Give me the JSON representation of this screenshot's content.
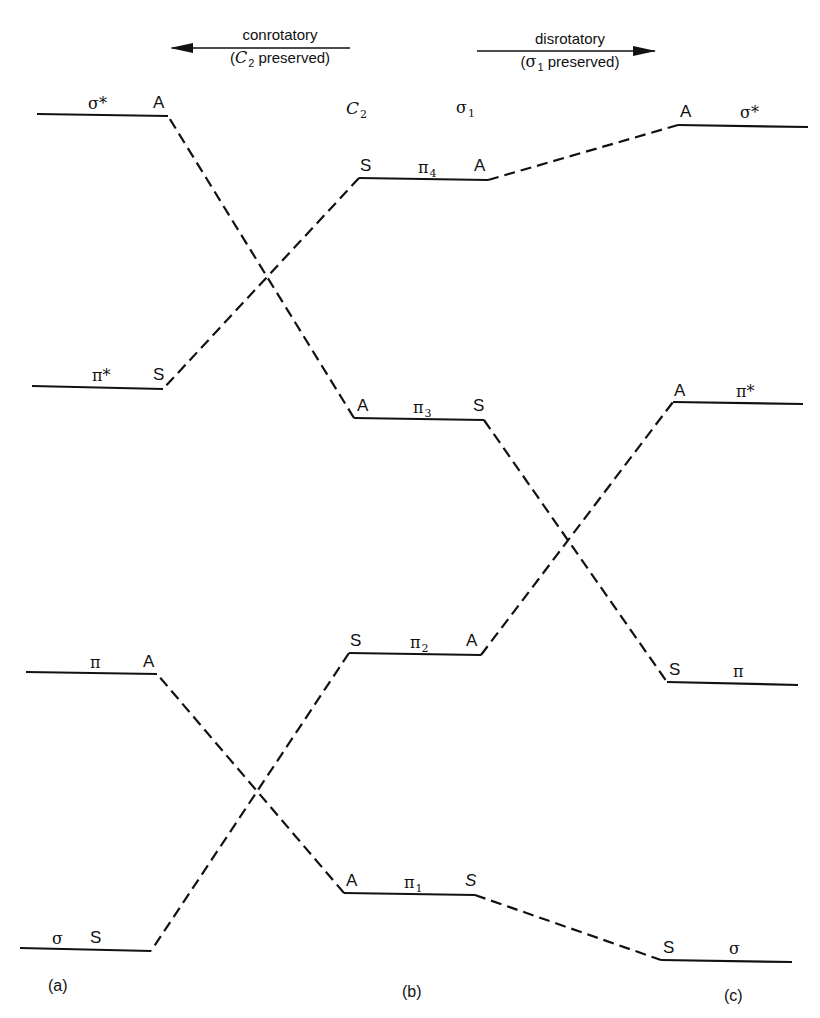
{
  "header": {
    "conrotatory": {
      "label": "conrotatory",
      "note_prefix": "(",
      "note_symbol": "C",
      "note_sub": "2",
      "note_suffix": " preserved)",
      "arrow_direction": "left"
    },
    "disrotatory": {
      "label": "disrotatory",
      "note_prefix": "(",
      "note_symbol": "σ",
      "note_sub": "1",
      "note_suffix": " preserved)",
      "arrow_direction": "right"
    }
  },
  "symmetry_elements": {
    "c2": {
      "symbol": "C",
      "sub": "2"
    },
    "sigma1": {
      "symbol": "σ",
      "sub": "1"
    }
  },
  "columns": {
    "a": {
      "label": "(a)",
      "levels": [
        {
          "orbital": "σ*",
          "symmetry": "A"
        },
        {
          "orbital": "π*",
          "symmetry": "S"
        },
        {
          "orbital": "π",
          "symmetry": "A"
        },
        {
          "orbital": "σ",
          "symmetry": "S"
        }
      ]
    },
    "b": {
      "label": "(b)",
      "levels": [
        {
          "orbital": "π",
          "sub": "4",
          "c2": "S",
          "sigma": "A"
        },
        {
          "orbital": "π",
          "sub": "3",
          "c2": "A",
          "sigma": "S"
        },
        {
          "orbital": "π",
          "sub": "2",
          "c2": "S",
          "sigma": "A"
        },
        {
          "orbital": "π",
          "sub": "1",
          "c2": "A",
          "sigma": "S"
        }
      ]
    },
    "c": {
      "label": "(c)",
      "levels": [
        {
          "orbital": "σ*",
          "symmetry": "A"
        },
        {
          "orbital": "π*",
          "symmetry": "A"
        },
        {
          "orbital": "π",
          "symmetry": "S"
        },
        {
          "orbital": "σ",
          "symmetry": "S"
        }
      ]
    }
  },
  "correlations": {
    "conrotatory": [
      {
        "from": "π4",
        "to": "π*"
      },
      {
        "from": "π3",
        "to": "σ*"
      },
      {
        "from": "π2",
        "to": "σ"
      },
      {
        "from": "π1",
        "to": "π"
      }
    ],
    "disrotatory": [
      {
        "from": "π4",
        "to": "σ*"
      },
      {
        "from": "π3",
        "to": "π"
      },
      {
        "from": "π2",
        "to": "π*"
      },
      {
        "from": "π1",
        "to": "σ"
      }
    ]
  }
}
